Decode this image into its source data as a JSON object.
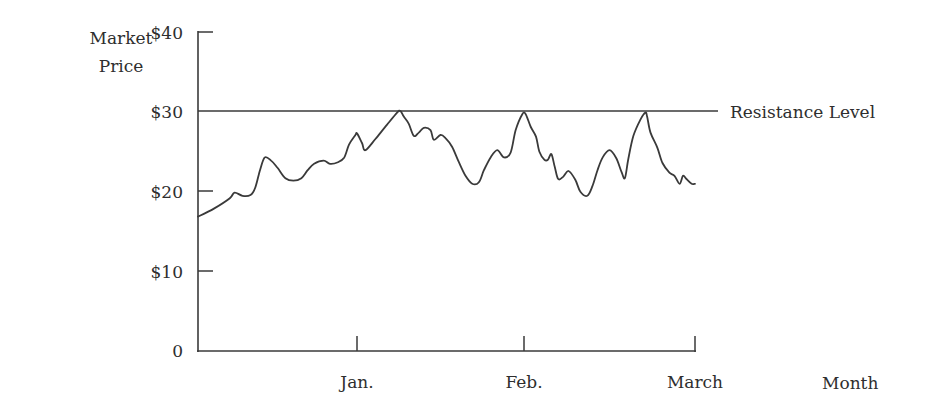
{
  "chart_data": {
    "type": "line",
    "title": "",
    "xlabel": "Month",
    "ylabel": "Market Price",
    "ylabel_lines": [
      "Market",
      "Price"
    ],
    "ylim": [
      0,
      40
    ],
    "yticks": [
      {
        "value": 0,
        "label": "0"
      },
      {
        "value": 10,
        "label": "$10"
      },
      {
        "value": 20,
        "label": "$20"
      },
      {
        "value": 30,
        "label": "$30"
      },
      {
        "value": 40,
        "label": "$40"
      }
    ],
    "xticks": [
      {
        "position": 1,
        "label": "Jan."
      },
      {
        "position": 2,
        "label": "Feb."
      },
      {
        "position": 3,
        "label": "March"
      }
    ],
    "xlim": [
      0,
      3
    ],
    "grid": false,
    "annotations": [
      {
        "type": "hline",
        "y": 30,
        "label": "Resistance Level"
      }
    ],
    "series": [
      {
        "name": "Market Price",
        "x": [
          0.0,
          0.1,
          0.2,
          0.23,
          0.28,
          0.33,
          0.36,
          0.39,
          0.42,
          0.46,
          0.5,
          0.55,
          0.6,
          0.65,
          0.69,
          0.73,
          0.79,
          0.83,
          0.88,
          0.92,
          0.95,
          0.99,
          1.0,
          1.03,
          1.05,
          1.11,
          1.18,
          1.24,
          1.26,
          1.28,
          1.31,
          1.34,
          1.37,
          1.4,
          1.44,
          1.46,
          1.5,
          1.53,
          1.57,
          1.61,
          1.65,
          1.69,
          1.73,
          1.76,
          1.8,
          1.84,
          1.88,
          1.92,
          1.95,
          1.99,
          2.01,
          2.04,
          2.07,
          2.09,
          2.12,
          2.14,
          2.16,
          2.18,
          2.2,
          2.23,
          2.26,
          2.3,
          2.33,
          2.37,
          2.4,
          2.43,
          2.46,
          2.5,
          2.54,
          2.57,
          2.59,
          2.61,
          2.64,
          2.68,
          2.71,
          2.72,
          2.74,
          2.78,
          2.81,
          2.85,
          2.88,
          2.91,
          2.93,
          2.95,
          2.98,
          3.0
        ],
        "values": [
          16.8,
          17.8,
          19.1,
          19.8,
          19.4,
          19.5,
          20.4,
          22.6,
          24.2,
          23.8,
          22.9,
          21.6,
          21.3,
          21.6,
          22.6,
          23.4,
          23.8,
          23.4,
          23.6,
          24.2,
          25.8,
          27.0,
          27.2,
          26.0,
          25.1,
          26.5,
          28.3,
          29.8,
          30.0,
          29.3,
          28.4,
          26.9,
          27.3,
          27.9,
          27.6,
          26.4,
          27.0,
          26.6,
          25.5,
          23.6,
          21.9,
          20.9,
          21.1,
          22.6,
          24.2,
          25.1,
          24.2,
          24.8,
          27.6,
          29.6,
          29.6,
          28.0,
          26.8,
          24.9,
          23.9,
          23.9,
          24.6,
          23.0,
          21.5,
          21.8,
          22.5,
          21.4,
          19.9,
          19.4,
          20.6,
          22.6,
          24.2,
          25.1,
          24.1,
          22.4,
          21.6,
          24.0,
          26.9,
          28.9,
          29.8,
          29.3,
          27.3,
          25.4,
          23.5,
          22.3,
          21.9,
          20.9,
          21.9,
          21.5,
          20.9,
          20.9
        ]
      }
    ]
  },
  "labels": {
    "ylabel_line1": "Market",
    "ylabel_line2": "Price",
    "y40": "$40",
    "y30": "$30",
    "y20": "$20",
    "y10": "$10",
    "y0": "0",
    "jan": "Jan.",
    "feb": "Feb.",
    "march": "March",
    "xaxis": "Month",
    "resistance": "Resistance Level"
  },
  "colors": {
    "line": "#3a3a3a",
    "axis": "#3a3a3a",
    "text": "#2e2e2e"
  }
}
